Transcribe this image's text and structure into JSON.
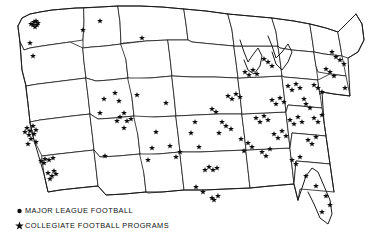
{
  "figure": {
    "region": "Continental United States",
    "projection": "state-outline thematic map",
    "background_color": "#ffffff",
    "line_color": "#1a1a1a",
    "marker_color": "#0d0d0d"
  },
  "legend": {
    "items": [
      {
        "glyph": "dot-icon",
        "marker": "dot",
        "label": "MAJOR LEAGUE FOOTBALL"
      },
      {
        "glyph": "star-icon",
        "marker": "star",
        "label": "COLLEGIATE FOOTBALL PROGRAMS"
      }
    ]
  },
  "chart_data": {
    "type": "scatter",
    "xlabel": "",
    "ylabel": "",
    "grid": false,
    "legend_position": "bottom-left",
    "series": [
      {
        "name": "MAJOR LEAGUE FOOTBALL",
        "marker": "dot",
        "color": "#0d0d0d",
        "count": 0,
        "note": "Dot symbol defined in legend; league sites coincide with starred metro clusters",
        "points": []
      },
      {
        "name": "COLLEGIATE FOOTBALL PROGRAMS",
        "marker": "star",
        "color": "#0d0d0d",
        "count": 128,
        "points": [
          [
            34,
            22
          ],
          [
            36,
            21
          ],
          [
            33,
            25
          ],
          [
            37,
            25
          ],
          [
            35,
            27
          ],
          [
            31,
            24
          ],
          [
            38,
            23
          ],
          [
            30,
            43
          ],
          [
            33,
            56
          ],
          [
            83,
            30
          ],
          [
            100,
            21
          ],
          [
            27,
            128
          ],
          [
            30,
            131
          ],
          [
            33,
            126
          ],
          [
            36,
            130
          ],
          [
            29,
            135
          ],
          [
            34,
            134
          ],
          [
            25,
            132
          ],
          [
            31,
            139
          ],
          [
            36,
            142
          ],
          [
            28,
            144
          ],
          [
            41,
            161
          ],
          [
            45,
            159
          ],
          [
            49,
            160
          ],
          [
            53,
            158
          ],
          [
            44,
            163
          ],
          [
            48,
            173
          ],
          [
            52,
            176
          ],
          [
            56,
            174
          ],
          [
            50,
            179
          ],
          [
            54,
            171
          ],
          [
            115,
            93
          ],
          [
            119,
            101
          ],
          [
            131,
            119
          ],
          [
            148,
            160
          ],
          [
            104,
            99
          ],
          [
            100,
            113
          ],
          [
            105,
            156
          ],
          [
            117,
            121
          ],
          [
            124,
            113
          ],
          [
            120,
            117
          ],
          [
            127,
            121
          ],
          [
            124,
            128
          ],
          [
            152,
            148
          ],
          [
            156,
            132
          ],
          [
            142,
            38
          ],
          [
            137,
            95
          ],
          [
            166,
            103
          ],
          [
            170,
            146
          ],
          [
            176,
            157
          ],
          [
            180,
            152
          ],
          [
            196,
            187
          ],
          [
            203,
            192
          ],
          [
            212,
            198
          ],
          [
            214,
            200
          ],
          [
            218,
            196
          ],
          [
            209,
            167
          ],
          [
            213,
            170
          ],
          [
            217,
            168
          ],
          [
            205,
            170
          ],
          [
            191,
            133
          ],
          [
            195,
            122
          ],
          [
            199,
            147
          ],
          [
            212,
            109
          ],
          [
            216,
            112
          ],
          [
            228,
            96
          ],
          [
            232,
            99
          ],
          [
            236,
            94
          ],
          [
            240,
            97
          ],
          [
            222,
            122
          ],
          [
            226,
            126
          ],
          [
            231,
            129
          ],
          [
            219,
            133
          ],
          [
            245,
            72
          ],
          [
            249,
            75
          ],
          [
            253,
            70
          ],
          [
            257,
            74
          ],
          [
            268,
            62
          ],
          [
            272,
            66
          ],
          [
            264,
            59
          ],
          [
            241,
            139
          ],
          [
            248,
            143
          ],
          [
            252,
            147
          ],
          [
            244,
            151
          ],
          [
            256,
            118
          ],
          [
            260,
            122
          ],
          [
            264,
            116
          ],
          [
            268,
            120
          ],
          [
            272,
            100
          ],
          [
            276,
            104
          ],
          [
            280,
            98
          ],
          [
            284,
            102
          ],
          [
            288,
            86
          ],
          [
            292,
            90
          ],
          [
            296,
            84
          ],
          [
            300,
            88
          ],
          [
            262,
            152
          ],
          [
            266,
            156
          ],
          [
            270,
            149
          ],
          [
            274,
            134
          ],
          [
            278,
            138
          ],
          [
            282,
            131
          ],
          [
            286,
            136
          ],
          [
            290,
            120
          ],
          [
            294,
            124
          ],
          [
            298,
            117
          ],
          [
            302,
            122
          ],
          [
            306,
            104
          ],
          [
            310,
            108
          ],
          [
            304,
            99
          ],
          [
            292,
            160
          ],
          [
            296,
            164
          ],
          [
            300,
            157
          ],
          [
            308,
            140
          ],
          [
            312,
            144
          ],
          [
            316,
            137
          ],
          [
            314,
            118
          ],
          [
            318,
            122
          ],
          [
            322,
            115
          ],
          [
            340,
            60
          ],
          [
            344,
            64
          ],
          [
            336,
            57
          ],
          [
            330,
            72
          ],
          [
            334,
            76
          ],
          [
            326,
            69
          ],
          [
            318,
            88
          ],
          [
            322,
            92
          ],
          [
            314,
            85
          ],
          [
            306,
            176
          ],
          [
            316,
            186
          ],
          [
            326,
            196
          ],
          [
            330,
            205
          ],
          [
            322,
            212
          ],
          [
            332,
            52
          ],
          [
            345,
            88
          ]
        ]
      }
    ],
    "annotations": [
      {
        "text": "MAJOR LEAGUE FOOTBALL",
        "kind": "legend-entry"
      },
      {
        "text": "COLLEGIATE FOOTBALL PROGRAMS",
        "kind": "legend-entry"
      }
    ]
  }
}
